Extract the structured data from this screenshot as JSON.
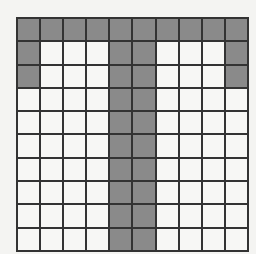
{
  "grid": {
    "columns": 10,
    "visible_rows": 10,
    "colors": {
      "filled": "#8a8a8a",
      "empty": "#f7f7f5",
      "line": "#333333"
    },
    "pattern": [
      [
        1,
        1,
        1,
        1,
        1,
        1,
        1,
        1,
        1,
        1
      ],
      [
        1,
        0,
        0,
        0,
        1,
        1,
        0,
        0,
        0,
        1
      ],
      [
        1,
        0,
        0,
        0,
        1,
        1,
        0,
        0,
        0,
        1
      ],
      [
        0,
        0,
        0,
        0,
        1,
        1,
        0,
        0,
        0,
        0
      ],
      [
        0,
        0,
        0,
        0,
        1,
        1,
        0,
        0,
        0,
        0
      ],
      [
        0,
        0,
        0,
        0,
        1,
        1,
        0,
        0,
        0,
        0
      ],
      [
        0,
        0,
        0,
        0,
        1,
        1,
        0,
        0,
        0,
        0
      ],
      [
        0,
        0,
        0,
        0,
        1,
        1,
        0,
        0,
        0,
        0
      ],
      [
        0,
        0,
        0,
        0,
        1,
        1,
        0,
        0,
        0,
        0
      ],
      [
        0,
        0,
        0,
        0,
        1,
        1,
        0,
        0,
        0,
        0
      ]
    ]
  }
}
